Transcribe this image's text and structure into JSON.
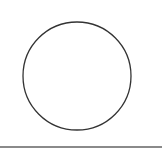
{
  "shape": {
    "type": "circle",
    "cx": 77,
    "cy": 76,
    "r": 54,
    "stroke": "#333333",
    "fill": "#ffffff"
  },
  "rule": {
    "color": "#8a8a8a"
  }
}
